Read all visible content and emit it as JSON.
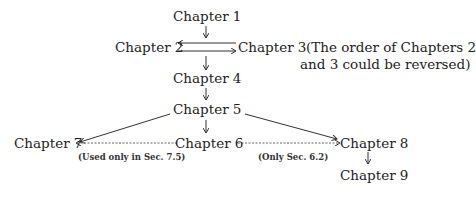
{
  "nodes": {
    "ch1": "Chapter 1",
    "ch2": "Chapter 2",
    "ch3": "Chapter 3",
    "ch4": "Chapter 4",
    "ch5": "Chapter 5",
    "ch6": "Chapter 6",
    "ch7": "Chapter 7",
    "ch8": "Chapter 8",
    "ch9": "Chapter 9"
  },
  "notes": {
    "order_line1": "(The order of Chapters 2",
    "order_line2": "and 3 could be reversed)",
    "ch6_to_ch7": "(Used only in Sec. 7.5)",
    "ch6_to_ch8": "(Only Sec. 6.2)"
  },
  "edges": [
    {
      "from": "ch1",
      "to": "ch2_3",
      "style": "solid"
    },
    {
      "from": "ch2",
      "to": "ch3",
      "style": "solid"
    },
    {
      "from": "ch3",
      "to": "ch2",
      "style": "solid"
    },
    {
      "from": "ch2_3",
      "to": "ch4",
      "style": "solid"
    },
    {
      "from": "ch4",
      "to": "ch5",
      "style": "solid"
    },
    {
      "from": "ch5",
      "to": "ch6",
      "style": "solid"
    },
    {
      "from": "ch5",
      "to": "ch7",
      "style": "solid"
    },
    {
      "from": "ch5",
      "to": "ch8",
      "style": "solid"
    },
    {
      "from": "ch6",
      "to": "ch7",
      "style": "dotted"
    },
    {
      "from": "ch6",
      "to": "ch8",
      "style": "dotted"
    },
    {
      "from": "ch8",
      "to": "ch9",
      "style": "solid"
    }
  ]
}
